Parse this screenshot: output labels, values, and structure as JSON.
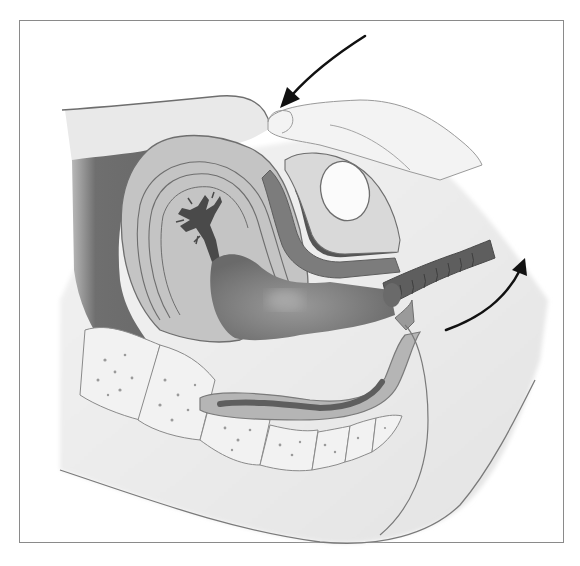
{
  "figure": {
    "title": "Bimanual pelvic examination (sagittal section)",
    "caption": "",
    "style": "grayscale medical illustration",
    "frame": {
      "x": 19,
      "y": 20,
      "width": 545,
      "height": 523,
      "border_color": "#8a8a8a"
    }
  },
  "structures": [
    {
      "id": "abdominal-wall",
      "label": "Abdominal wall"
    },
    {
      "id": "examiner-hand",
      "label": "Examiner's hand on abdomen"
    },
    {
      "id": "uterus",
      "label": "Uterus"
    },
    {
      "id": "endometrial-cavity",
      "label": "Endometrial cavity"
    },
    {
      "id": "bladder",
      "label": "Bladder"
    },
    {
      "id": "pubic-symphysis",
      "label": "Pubic symphysis"
    },
    {
      "id": "vagina",
      "label": "Vagina"
    },
    {
      "id": "cervix",
      "label": "Cervix"
    },
    {
      "id": "examining-fingers",
      "label": "Examining fingers (gloved)"
    },
    {
      "id": "rectum",
      "label": "Rectum"
    },
    {
      "id": "sacrum-coccyx",
      "label": "Sacrum and coccyx"
    },
    {
      "id": "perineum",
      "label": "Perineum / buttock"
    }
  ],
  "arrows": [
    {
      "id": "downward-pressure",
      "direction": "down-left",
      "meaning": "Abdominal hand presses downward"
    },
    {
      "id": "upward-pressure",
      "direction": "up-right",
      "meaning": "Vaginal fingers push upward"
    }
  ],
  "colors": {
    "background": "#ffffff",
    "outline": "#6e6e6e",
    "light_tissue": "#ededed",
    "mid_tissue": "#bdbdbd",
    "dark_tissue": "#7a7a7a",
    "darkest": "#4d4d4d",
    "arrow": "#111111"
  }
}
